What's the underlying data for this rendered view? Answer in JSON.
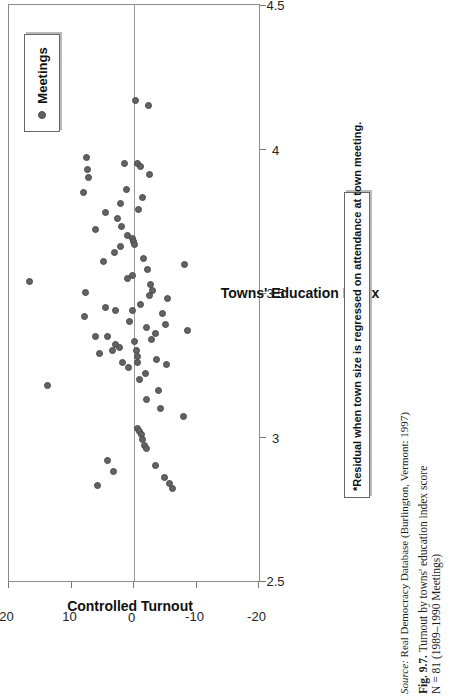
{
  "chart_data": {
    "type": "scatter",
    "title": "",
    "xlabel": "Towns' Education Index",
    "ylabel": "Controlled Turnout",
    "xlim": [
      2.5,
      4.5
    ],
    "ylim": [
      -20,
      20
    ],
    "xticks": [
      "2.5",
      "3",
      "3.5",
      "4",
      "4.5"
    ],
    "xtick_values": [
      2.5,
      3,
      3.5,
      4,
      4.5
    ],
    "yticks": [
      "20",
      "10",
      "0",
      "-10",
      "-20"
    ],
    "ytick_values": [
      20,
      10,
      0,
      -10,
      -20
    ],
    "grid": false,
    "zero_reference_line": true,
    "legend": {
      "position": "top-right-inside",
      "entries": [
        "Meetings"
      ]
    },
    "series": [
      {
        "name": "Meetings",
        "marker": "circle",
        "color": "#636363",
        "n": 81,
        "points": [
          [
            3.54,
            16.8
          ],
          [
            3.18,
            13.8
          ],
          [
            3.85,
            8.1
          ],
          [
            3.97,
            7.6
          ],
          [
            3.93,
            7.5
          ],
          [
            3.9,
            7.3
          ],
          [
            3.5,
            7.8
          ],
          [
            3.42,
            8.0
          ],
          [
            3.72,
            6.1
          ],
          [
            3.35,
            6.2
          ],
          [
            3.29,
            5.5
          ],
          [
            2.83,
            5.9
          ],
          [
            3.61,
            4.9
          ],
          [
            3.78,
            4.6
          ],
          [
            3.45,
            4.5
          ],
          [
            3.35,
            4.2
          ],
          [
            2.92,
            4.2
          ],
          [
            2.88,
            3.3
          ],
          [
            3.3,
            3.5
          ],
          [
            3.32,
            3.0
          ],
          [
            3.44,
            2.9
          ],
          [
            3.64,
            3.1
          ],
          [
            3.76,
            2.6
          ],
          [
            3.81,
            2.1
          ],
          [
            3.73,
            2.0
          ],
          [
            3.66,
            2.2
          ],
          [
            3.31,
            2.3
          ],
          [
            3.26,
            1.8
          ],
          [
            3.95,
            1.5
          ],
          [
            3.86,
            1.2
          ],
          [
            3.7,
            1.0
          ],
          [
            3.55,
            1.1
          ],
          [
            3.4,
            0.8
          ],
          [
            3.24,
            0.9
          ],
          [
            3.69,
            0.2
          ],
          [
            3.68,
            0.1
          ],
          [
            3.67,
            0.0
          ],
          [
            3.56,
            0.3
          ],
          [
            3.44,
            0.2
          ],
          [
            3.33,
            0.0
          ],
          [
            3.3,
            -0.4
          ],
          [
            3.28,
            -0.6
          ],
          [
            3.26,
            -0.5
          ],
          [
            3.2,
            -0.8
          ],
          [
            3.03,
            -0.6
          ],
          [
            3.02,
            -0.9
          ],
          [
            3.01,
            -1.2
          ],
          [
            2.99,
            -1.4
          ],
          [
            2.97,
            -1.7
          ],
          [
            2.96,
            -2.0
          ],
          [
            3.95,
            -0.6
          ],
          [
            3.94,
            -1.0
          ],
          [
            3.91,
            -2.4
          ],
          [
            3.83,
            -1.3
          ],
          [
            3.79,
            -0.7
          ],
          [
            3.62,
            -1.5
          ],
          [
            3.58,
            -2.2
          ],
          [
            3.53,
            -2.6
          ],
          [
            3.51,
            -3.0
          ],
          [
            3.49,
            -2.4
          ],
          [
            3.46,
            -1.1
          ],
          [
            3.38,
            -2.0
          ],
          [
            3.36,
            -3.4
          ],
          [
            3.34,
            -2.8
          ],
          [
            3.27,
            -3.6
          ],
          [
            3.22,
            -1.9
          ],
          [
            3.16,
            -3.9
          ],
          [
            3.13,
            -2.0
          ],
          [
            3.1,
            -4.3
          ],
          [
            4.17,
            -0.3
          ],
          [
            4.15,
            -2.3
          ],
          [
            3.48,
            -5.4
          ],
          [
            3.43,
            -4.6
          ],
          [
            3.39,
            -5.0
          ],
          [
            3.25,
            -5.2
          ],
          [
            2.9,
            -3.5
          ],
          [
            2.86,
            -4.9
          ],
          [
            2.84,
            -5.6
          ],
          [
            2.82,
            -6.1
          ],
          [
            3.07,
            -7.9
          ],
          [
            3.6,
            -8.0
          ],
          [
            3.37,
            -8.6
          ]
        ]
      }
    ],
    "footnote": "*Residual when town size is regressed on attendance at town meeting."
  },
  "legend": {
    "label": "Meetings",
    "marker_icon": "filled-circle-icon"
  },
  "axes": {
    "x_title": "Towns' Education Index",
    "y_title": "Controlled Turnout",
    "x_tick_labels": [
      "2.5",
      "3",
      "3.5",
      "4",
      "4.5"
    ],
    "y_tick_labels": [
      "20",
      "10",
      "0",
      "-10",
      "-20"
    ]
  },
  "footnote": {
    "text": "*Residual when town size is regressed on attendance at town meeting."
  },
  "caption": {
    "source_word": "Source:",
    "source_text": " Real Democracy Database (Burlington, Vermont: 1997)",
    "fig_number": "Fig. 9.7.",
    "fig_title": "  Turnout by towns' education index score",
    "n_line": "N = 81 (1989–1990 Meetings)"
  },
  "colors": {
    "marker": "#636363",
    "frame": "#8c8c8c",
    "zero_line": "#9a9a9a",
    "text": "#1a1a1a"
  }
}
